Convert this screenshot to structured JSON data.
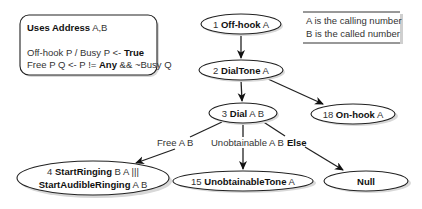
{
  "declarations": {
    "title_bold": "Uses Address",
    "title_rest": " A,B",
    "line1_prefix": "Off-hook P / Busy P <- ",
    "line1_bold": "True",
    "line2_prefix": "Free P Q <- P != ",
    "line2_bold": "Any",
    "line2_suffix": " && ~Busy Q"
  },
  "legend": {
    "line1": "A is the calling number",
    "line2": "B is the called number"
  },
  "nodes": {
    "n1": {
      "num": "1 ",
      "bold": "Off-hook",
      "args": " A"
    },
    "n2": {
      "num": "2 ",
      "bold": "DialTone",
      "args": " A"
    },
    "n3": {
      "num": "3 ",
      "bold": "Dial",
      "args": " A B"
    },
    "n18": {
      "num": "18 ",
      "bold": "On-hook",
      "args": " A"
    },
    "n4": {
      "num": "4 ",
      "bold1": "StartRinging",
      "args1": " B A |||",
      "bold2": "StartAudibleRinging",
      "args2": " A B"
    },
    "n15": {
      "num": "15 ",
      "bold": "UnobtainableTone",
      "args": " A"
    },
    "null": {
      "bold": "Null"
    }
  },
  "edges": {
    "free": "Free A B",
    "unobtainable": "Unobtainable A B",
    "else": "Else"
  }
}
